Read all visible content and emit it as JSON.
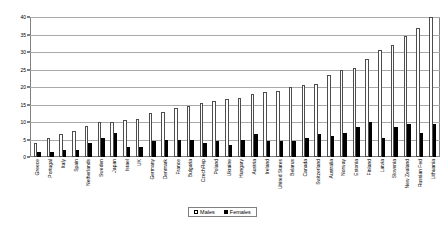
{
  "chart_data": {
    "type": "bar",
    "title": "",
    "xlabel": "",
    "ylabel": "",
    "ylim": [
      0,
      40
    ],
    "yticks": [
      0,
      5,
      10,
      15,
      20,
      25,
      30,
      35,
      40
    ],
    "grid": true,
    "legend_position": "bottom",
    "categories": [
      "Greece",
      "Portugal",
      "Italy",
      "Spain",
      "Netherlands",
      "Sweden",
      "Japan",
      "Israel",
      "UK",
      "Germany",
      "Denmark",
      "France",
      "Bulgaria",
      "CzechRep",
      "Poland",
      "Ukraine",
      "Hungary",
      "Austria",
      "Ireland",
      "United States",
      "Belarus",
      "Canada",
      "Switzerland",
      "Australia",
      "Norway",
      "Estonia",
      "Finland",
      "Latvia",
      "Slovenia",
      "New Zealand",
      "Russian Fed",
      "Lithuania"
    ],
    "series": [
      {
        "name": "Males",
        "color": "#ffffff",
        "values": [
          4.0,
          5.5,
          6.5,
          7.5,
          9.0,
          10.0,
          10.0,
          10.5,
          11.0,
          12.5,
          13.0,
          14.0,
          14.5,
          15.5,
          16.0,
          16.5,
          17.0,
          18.0,
          18.5,
          19.0,
          20.0,
          20.5,
          21.0,
          23.5,
          25.0,
          25.5,
          28.0,
          30.5,
          32.0,
          34.5,
          37.0,
          40.0
        ]
      },
      {
        "name": "Females",
        "color": "#000000",
        "values": [
          1.5,
          1.5,
          2.0,
          2.0,
          4.0,
          5.5,
          7.0,
          3.0,
          3.0,
          4.5,
          5.0,
          5.0,
          5.0,
          4.0,
          4.5,
          3.5,
          5.0,
          6.5,
          4.5,
          4.5,
          4.5,
          5.5,
          6.5,
          6.0,
          7.0,
          8.5,
          10.0,
          5.5,
          8.5,
          9.5,
          7.0,
          9.5
        ]
      }
    ],
    "legend": [
      "Males",
      "Females"
    ]
  }
}
